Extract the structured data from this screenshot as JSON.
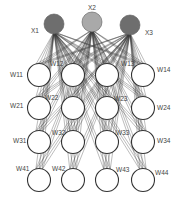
{
  "diagram": {
    "type": "neural-network",
    "inputs": [
      {
        "label": "X1",
        "cx": 54,
        "cy": 24,
        "r": 10,
        "color": "#6e6e6e",
        "label_x": 31,
        "label_y": 33
      },
      {
        "label": "X2",
        "cx": 92,
        "cy": 22,
        "r": 10,
        "color": "#a9a9a9",
        "label_x": 88,
        "label_y": 10
      },
      {
        "label": "X3",
        "cx": 130,
        "cy": 25,
        "r": 10,
        "color": "#6e6e6e",
        "label_x": 145,
        "label_y": 35
      }
    ],
    "grid_columns_x": [
      39,
      73,
      107,
      143
    ],
    "grid_rows_y": [
      75,
      108,
      142,
      180
    ],
    "node_radius": 11.5,
    "weights": [
      [
        "W11",
        "W12",
        "W13",
        "W14"
      ],
      [
        "W21",
        "W22",
        "W23",
        "W24"
      ],
      [
        "W31",
        "W32",
        "W33",
        "W34"
      ],
      [
        "W41",
        "W42",
        "W43",
        "W44"
      ]
    ],
    "weight_label_positions": [
      [
        [
          10,
          77
        ],
        [
          50,
          66
        ],
        [
          121,
          66
        ],
        [
          157,
          72
        ]
      ],
      [
        [
          10,
          108
        ],
        [
          45,
          100
        ],
        [
          114,
          101
        ],
        [
          157,
          110
        ]
      ],
      [
        [
          13,
          143
        ],
        [
          52,
          135
        ],
        [
          116,
          135
        ],
        [
          157,
          143
        ]
      ],
      [
        [
          16,
          171
        ],
        [
          52,
          171
        ],
        [
          116,
          172
        ],
        [
          155,
          175
        ]
      ]
    ]
  }
}
